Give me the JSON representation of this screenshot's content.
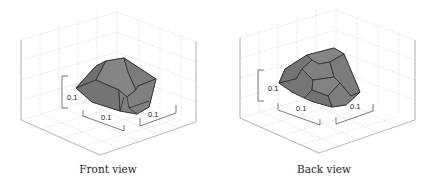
{
  "figure": {
    "panels": [
      {
        "caption": "Front view",
        "scale_labels": [
          "0.1",
          "0.1",
          "0.1"
        ],
        "colors": {
          "fill": "#7a7a7a",
          "edge": "#2f2f2f",
          "grid": "#c8c8c8",
          "axis": "#555555"
        }
      },
      {
        "caption": "Back view",
        "scale_labels": [
          "0.1",
          "0.1",
          "0.1"
        ],
        "colors": {
          "fill": "#7a7a7a",
          "edge": "#2f2f2f",
          "grid": "#c8c8c8",
          "axis": "#555555"
        }
      }
    ]
  }
}
